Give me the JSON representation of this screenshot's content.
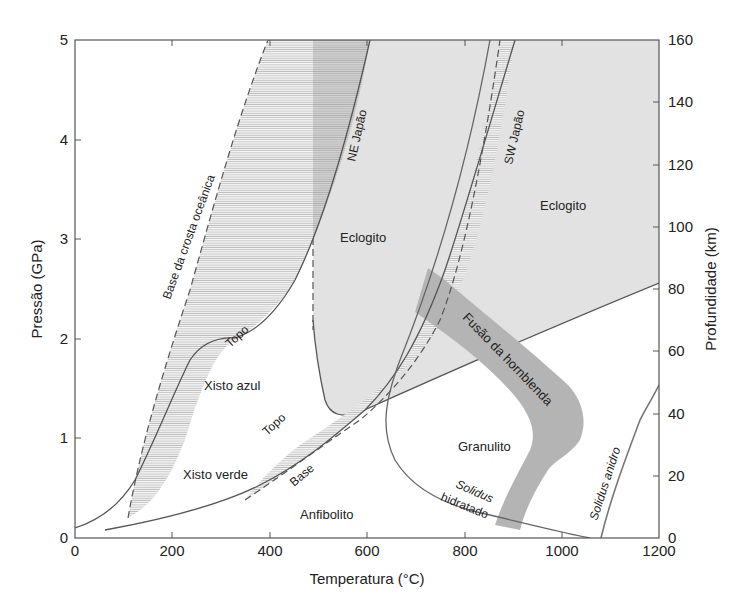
{
  "figure": {
    "type": "phase-diagram",
    "x_axis": {
      "title": "Temperatura (°C)",
      "ticks": [
        "0",
        "200",
        "400",
        "600",
        "800",
        "1000",
        "1200"
      ],
      "range": [
        0,
        1200
      ]
    },
    "y_axis_left": {
      "title": "Pressão (GPa)",
      "ticks": [
        "0",
        "1",
        "2",
        "3",
        "4",
        "5"
      ],
      "range": [
        0,
        5
      ]
    },
    "y_axis_right": {
      "title": "Profundidade (km)",
      "ticks": [
        "0",
        "20",
        "40",
        "60",
        "80",
        "100",
        "120",
        "140",
        "160"
      ],
      "range": [
        0,
        160
      ]
    },
    "regions": {
      "eclogito_1": "Eclogito",
      "eclogito_2": "Eclogito",
      "xisto_azul": "Xisto azul",
      "xisto_verde": "Xisto verde",
      "anfibolito": "Anfibolito",
      "granulito": "Granulito",
      "fusao_hornblenda": "Fusão da hornblenda"
    },
    "curves": {
      "base_crosta": "Base da crosta oceânica",
      "ne_japao": "NE Japão",
      "sw_japao": "SW Japão",
      "topo_ne": "Topo",
      "topo_sw": "Topo",
      "base_sw": "Base",
      "solidus_hidratado_1": "Solidus",
      "solidus_hidratado_2": "hidratado",
      "solidus_anidro": "Solidus anidro"
    },
    "colors": {
      "eclogite_fill": "#e2e2e2",
      "hornblende_band": "#b4b4b4",
      "dark_band": "#c8c8c8",
      "line": "#555555",
      "hatch": "#9a9a9a"
    }
  }
}
